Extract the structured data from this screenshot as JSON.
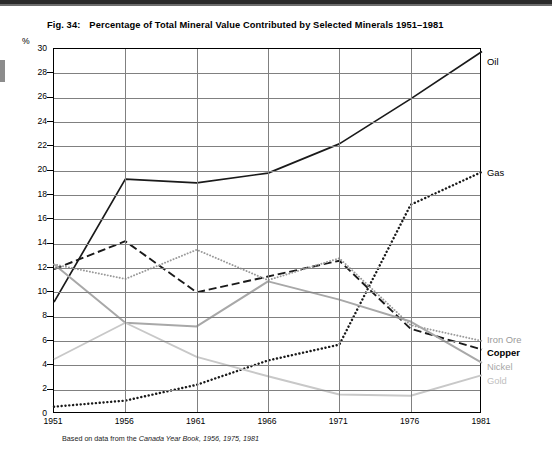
{
  "figure": {
    "number": "Fig. 34:",
    "title": "Percentage of Total Mineral Value Contributed by Selected Minerals 1951–1981",
    "unit_label": "%",
    "source_prefix": "Based on data from the ",
    "source_italic": "Canada Year Book, 1956, 1975, 1981"
  },
  "labels": {
    "oil": "Oil",
    "gas": "Gas",
    "iron_ore": "Iron Ore",
    "copper": "Copper",
    "nickel": "Nickel",
    "gold": "Gold"
  },
  "colors": {
    "oil": "#1a1a1a",
    "gas": "#1a1a1a",
    "copper": "#1a1a1a",
    "iron_ore": "#9a9a9a",
    "nickel": "#a8a8a8",
    "gold": "#c8c8c8",
    "grid": "#808080",
    "frame": "#000000",
    "background": "#ffffff"
  },
  "chart_data": {
    "type": "line",
    "title": "Percentage of Total Mineral Value Contributed by Selected Minerals 1951–1981",
    "xlabel": "",
    "ylabel": "%",
    "x": [
      1951,
      1956,
      1961,
      1966,
      1971,
      1976,
      1981
    ],
    "categories": [
      "1951",
      "1956",
      "1961",
      "1966",
      "1971",
      "1976",
      "1981"
    ],
    "xlim": [
      1951,
      1981
    ],
    "ylim": [
      0,
      30
    ],
    "yticks": [
      0,
      2,
      4,
      6,
      8,
      10,
      12,
      14,
      16,
      18,
      20,
      22,
      24,
      26,
      28,
      30
    ],
    "ytick_labels": [
      "0",
      "2",
      "4",
      "6",
      "8",
      "10",
      "12",
      "14",
      "16",
      "18",
      "20",
      "22",
      "24",
      "26",
      "28",
      "30"
    ],
    "grid": true,
    "legend": "series end labels at right edge",
    "series": [
      {
        "name": "Oil",
        "style": "solid",
        "color": "#1a1a1a",
        "width": 1.7,
        "values": [
          9.2,
          19.3,
          19.0,
          19.8,
          22.2,
          25.9,
          29.8
        ]
      },
      {
        "name": "Gas",
        "style": "dotted",
        "color": "#1a1a1a",
        "width": 2.4,
        "values": [
          0.6,
          1.1,
          2.4,
          4.4,
          5.7,
          17.2,
          19.9
        ]
      },
      {
        "name": "Copper",
        "style": "dashed",
        "color": "#1a1a1a",
        "width": 1.9,
        "values": [
          11.9,
          14.2,
          10.0,
          11.3,
          12.6,
          7.0,
          5.3
        ]
      },
      {
        "name": "Iron Ore",
        "style": "dotted",
        "color": "#9a9a9a",
        "width": 1.9,
        "values": [
          12.3,
          11.1,
          13.5,
          11.0,
          12.8,
          7.3,
          6.0
        ]
      },
      {
        "name": "Nickel",
        "style": "solid",
        "color": "#a8a8a8",
        "width": 2.0,
        "values": [
          12.3,
          7.5,
          7.2,
          10.9,
          9.4,
          7.6,
          4.2
        ]
      },
      {
        "name": "Gold",
        "style": "solid",
        "color": "#c8c8c8",
        "width": 1.9,
        "values": [
          4.5,
          7.5,
          4.7,
          3.1,
          1.6,
          1.5,
          3.2
        ]
      }
    ]
  }
}
